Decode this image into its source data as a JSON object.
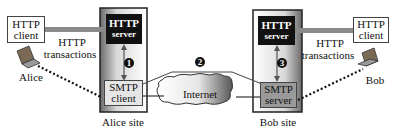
{
  "diagram": {
    "alice_site": {
      "label": "Alice site",
      "http_server": {
        "line1": "HTTP",
        "line2": "server"
      },
      "smtp_client": {
        "line1": "SMTP",
        "line2": "client"
      }
    },
    "bob_site": {
      "label": "Bob site",
      "http_server": {
        "line1": "HTTP",
        "line2": "server"
      },
      "smtp_server": {
        "line1": "SMTP",
        "line2": "server"
      }
    },
    "alice": {
      "name": "Alice",
      "http_client": {
        "line1": "HTTP",
        "line2": "client"
      },
      "transactions": {
        "line1": "HTTP",
        "line2": "transactions"
      }
    },
    "bob": {
      "name": "Bob",
      "http_client": {
        "line1": "HTTP",
        "line2": "client"
      },
      "transactions": {
        "line1": "HTTP",
        "line2": "transactions"
      }
    },
    "internet": {
      "label": "Internet"
    },
    "steps": [
      "1",
      "2",
      "3"
    ]
  }
}
